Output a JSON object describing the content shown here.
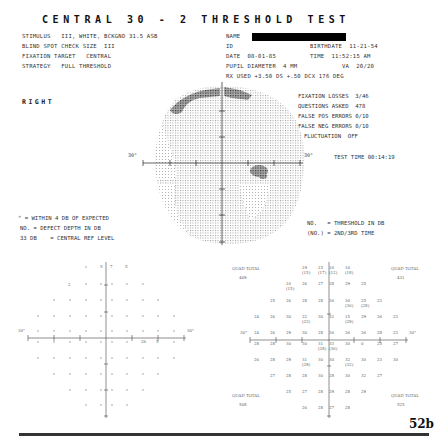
{
  "title": "CENTRAL 30 - 2 THRESHOLD TEST",
  "header": {
    "left": [
      "STIMULUS   III, WHITE, BCKGND 31.5 ASB",
      "BLIND SPOT CHECK SIZE  III",
      "FIXATION TARGET   CENTRAL",
      "STRATEGY   FULL THRESHOLD"
    ],
    "name_label": "NAME",
    "id_label": "ID",
    "birthdate": "BIRTHDATE  11-21-54",
    "date": "DATE  08-01-85",
    "time": "TIME  11:52:15 AM",
    "pupil": "PUPIL DIAMETER  4 MM",
    "va": "VA  20/20",
    "rx": "RX USED +3.50 DS +.50 DCX 176 DEG"
  },
  "eye": "RIGHT",
  "stats": {
    "fixation_losses": "FIXATION LOSSES  3/46",
    "questions_asked": "QUESTIONS ASKED  478",
    "false_pos": "FALSE POS ERRORS 0/10",
    "false_neg": "FALSE NEG ERRORS 0/10",
    "fluctuation": "FLUCTUATION  OFF",
    "test_time": "TEST TIME 00:14:19"
  },
  "grayscale": {
    "axis_label_left": "30°",
    "axis_label_right": "30°"
  },
  "legend_left": [
    "° = WITHIN 4 DB OF EXPECTED",
    "NO. = DEFECT DEPTH IN DB",
    "33 DB    = CENTRAL REF LEVEL"
  ],
  "legend_right": [
    "NO.   = THRESHOLD IN DB",
    "(NO.) = 2ND/3RD TIME"
  ],
  "defect_plot": {
    "axis_label_left": "30°",
    "axis_label_right": "30°",
    "values": [
      {
        "x": 102,
        "y": 267,
        "v": "5"
      },
      {
        "x": 113,
        "y": 267,
        "v": "7"
      },
      {
        "x": 127,
        "y": 267,
        "v": "5"
      },
      {
        "x": 70,
        "y": 284,
        "v": "2"
      },
      {
        "x": 143,
        "y": 340,
        "v": "26"
      },
      {
        "x": 158,
        "y": 340,
        "v": "5"
      }
    ]
  },
  "threshold_plot": {
    "axis_label_left": "30°",
    "axis_label_right": "30°",
    "quad_totals": [
      {
        "label": "QUAD TOTAL",
        "value": "469",
        "x": 234,
        "y": 270
      },
      {
        "label": "QUAD TOTAL",
        "value": "431",
        "x": 391,
        "y": 270
      },
      {
        "label": "QUAD TOTAL",
        "value": "508",
        "x": 234,
        "y": 397
      },
      {
        "label": "QUAD TOTAL",
        "value": "525",
        "x": 391,
        "y": 397
      }
    ],
    "rows": [
      {
        "y": 269,
        "cells": [
          [
            "19",
            "(15)"
          ],
          [
            "15",
            "(17)"
          ],
          [
            "16",
            "(12)"
          ],
          [
            "16",
            "(18)"
          ]
        ],
        "xs": [
          306,
          322,
          333,
          349
        ]
      },
      {
        "y": 285,
        "cells": [
          [
            "16",
            "(15)"
          ],
          [
            "26"
          ],
          [
            "27"
          ],
          [
            "28"
          ],
          [
            "29"
          ],
          [
            "25"
          ]
        ],
        "xs": [
          290,
          306,
          322,
          333,
          349,
          365
        ]
      },
      {
        "y": 302,
        "cells": [
          [
            "25"
          ],
          [
            "26"
          ],
          [
            "28"
          ],
          [
            "28"
          ],
          [
            "26"
          ],
          [
            "30",
            "(30)"
          ],
          [
            "25",
            "(28)"
          ],
          [
            "23"
          ]
        ],
        "xs": [
          274,
          290,
          306,
          322,
          333,
          349,
          365,
          381
        ]
      },
      {
        "y": 318,
        "cells": [
          [
            "24"
          ],
          [
            "26"
          ],
          [
            "30"
          ],
          [
            "22",
            "(23)"
          ],
          [
            "30"
          ],
          [
            "32"
          ],
          [
            "15",
            "(29)"
          ],
          [
            "29"
          ],
          [
            "26"
          ],
          [
            "23"
          ]
        ],
        "xs": [
          258,
          274,
          290,
          306,
          322,
          333,
          349,
          365,
          381,
          397
        ]
      },
      {
        "y": 334,
        "cells": [
          [
            "24"
          ],
          [
            "26"
          ],
          [
            "29"
          ],
          [
            "30"
          ],
          [
            "28"
          ],
          [
            "26"
          ],
          [
            "26"
          ],
          [
            "26"
          ],
          [
            "28"
          ],
          [
            "23"
          ]
        ],
        "xs": [
          258,
          274,
          290,
          306,
          322,
          333,
          349,
          365,
          381,
          397
        ]
      },
      {
        "y": 345,
        "cells": [
          [
            "28"
          ],
          [
            "28"
          ],
          [
            "30"
          ],
          [
            "30"
          ],
          [
            "31",
            "(28)"
          ],
          [
            "33",
            "(30)"
          ],
          [
            "30"
          ],
          [
            "0"
          ],
          [
            "25"
          ],
          [
            "27"
          ]
        ],
        "xs": [
          258,
          274,
          290,
          306,
          322,
          333,
          349,
          365,
          381,
          397
        ]
      },
      {
        "y": 361,
        "cells": [
          [
            "26"
          ],
          [
            "28"
          ],
          [
            "29"
          ],
          [
            "31",
            "(29)"
          ],
          [
            "30"
          ],
          [
            "30"
          ],
          [
            "32",
            "(32)"
          ],
          [
            "30"
          ],
          [
            "23"
          ],
          [
            "30"
          ]
        ],
        "xs": [
          258,
          274,
          290,
          306,
          322,
          333,
          349,
          365,
          381,
          397
        ]
      },
      {
        "y": 377,
        "cells": [
          [
            "27"
          ],
          [
            "28"
          ],
          [
            "28"
          ],
          [
            "30"
          ],
          [
            "28"
          ],
          [
            "30"
          ],
          [
            "32"
          ],
          [
            "27"
          ]
        ],
        "xs": [
          274,
          290,
          306,
          322,
          333,
          349,
          365,
          381
        ]
      },
      {
        "y": 393,
        "cells": [
          [
            "25"
          ],
          [
            "27"
          ],
          [
            "28"
          ],
          [
            "29"
          ],
          [
            "28"
          ],
          [
            "29"
          ]
        ],
        "xs": [
          290,
          306,
          322,
          333,
          349,
          365
        ]
      },
      {
        "y": 409,
        "cells": [
          [
            "26"
          ],
          [
            "28"
          ],
          [
            "27"
          ],
          [
            "28"
          ]
        ],
        "xs": [
          306,
          322,
          333,
          349
        ]
      }
    ]
  },
  "page_number": "52b"
}
